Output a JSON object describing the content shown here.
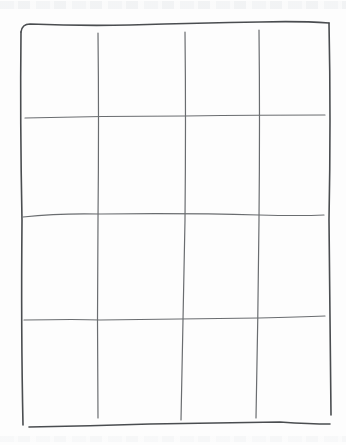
{
  "drawing": {
    "description": "Hand-drawn pencil grid on white paper",
    "grid": {
      "rows": 4,
      "columns": 4
    },
    "stroke_color": "#4a4d50",
    "paper_color": "#fdfdfd",
    "outer_border": {
      "left": 20,
      "top": 22,
      "right": 330,
      "bottom": 420
    },
    "vertical_lines_x": [
      98,
      185,
      258
    ],
    "horizontal_lines_y": [
      117,
      215,
      320
    ]
  }
}
